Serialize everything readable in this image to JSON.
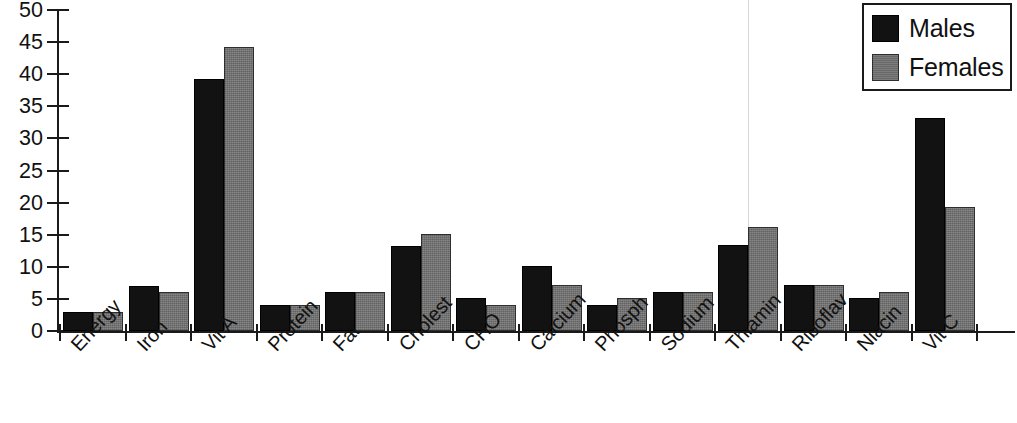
{
  "chart_data": {
    "type": "bar",
    "title": "",
    "xlabel": "",
    "ylabel": "",
    "ylim": [
      0,
      50
    ],
    "yticks": [
      0,
      5,
      10,
      15,
      20,
      25,
      30,
      35,
      40,
      45,
      50
    ],
    "grid": false,
    "legend_position": "top-right",
    "categories": [
      "Energy",
      "Iron",
      "Vit A",
      "Protein",
      "Fat",
      "Cholest",
      "CHO",
      "Calcium",
      "Phosph",
      "Sodium",
      "Thiamin",
      "Riboflav",
      "Niacin",
      "Vit C"
    ],
    "series": [
      {
        "name": "Males",
        "color": "#121212",
        "values": [
          3.0,
          7.0,
          39.2,
          4.0,
          6.0,
          13.2,
          5.2,
          10.1,
          4.0,
          6.0,
          13.4,
          7.2,
          5.2,
          33.2
        ]
      },
      {
        "name": "Females",
        "color": "#6e6e6e",
        "values": [
          3.0,
          6.0,
          44.3,
          4.0,
          6.0,
          15.1,
          4.0,
          7.1,
          5.1,
          6.0,
          16.2,
          7.2,
          6.1,
          19.3
        ]
      }
    ]
  },
  "legend": {
    "items": [
      {
        "label": "Males"
      },
      {
        "label": "Females"
      }
    ]
  }
}
